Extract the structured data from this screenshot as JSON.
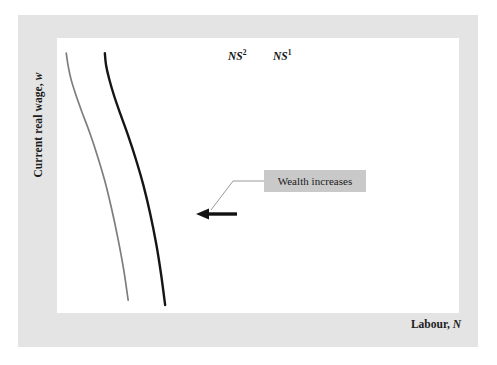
{
  "figure": {
    "background_color": "#ffffff",
    "frame_color": "#e4e4e4",
    "plot_background": "#ffffff"
  },
  "axes": {
    "y_title_prefix": "Current real wage, ",
    "y_title_symbol": "w",
    "x_title_prefix": "Labour, ",
    "x_title_symbol": "N"
  },
  "curves": {
    "ns1": {
      "label_prefix": "NS",
      "label_superscript": "1",
      "color": "#151515",
      "stroke_width": 2.4
    },
    "ns2": {
      "label_prefix": "NS",
      "label_superscript": "2",
      "color": "#7d7d7d",
      "stroke_width": 1.7
    }
  },
  "annotation": {
    "text": "Wealth increases",
    "box_color": "#c9c9c9",
    "text_color": "#1a1a1a",
    "leader_color": "#9a9a9a",
    "arrow_color": "#111111"
  },
  "chart_data": {
    "type": "line",
    "title": "",
    "subtitle": "",
    "xlabel": "Labour, N",
    "ylabel": "Current real wage, w",
    "xlim": [
      0,
      1
    ],
    "ylim": [
      0,
      1
    ],
    "grid": false,
    "legend": "inline-curve-labels",
    "axis_ticks": {
      "x": [],
      "y": []
    },
    "series": [
      {
        "name": "NS2",
        "color": "#7d7d7d",
        "description": "Labour supply curve after wealth increases (shifted left)",
        "points": [
          {
            "x": 0.177,
            "y": 0.047
          },
          {
            "x": 0.166,
            "y": 0.157
          },
          {
            "x": 0.152,
            "y": 0.268
          },
          {
            "x": 0.136,
            "y": 0.378
          },
          {
            "x": 0.119,
            "y": 0.48
          },
          {
            "x": 0.1,
            "y": 0.574
          },
          {
            "x": 0.081,
            "y": 0.657
          },
          {
            "x": 0.062,
            "y": 0.731
          },
          {
            "x": 0.046,
            "y": 0.797
          },
          {
            "x": 0.034,
            "y": 0.855
          },
          {
            "x": 0.027,
            "y": 0.905
          },
          {
            "x": 0.023,
            "y": 0.945
          }
        ]
      },
      {
        "name": "NS1",
        "color": "#151515",
        "description": "Original labour supply curve",
        "points": [
          {
            "x": 0.269,
            "y": 0.029
          },
          {
            "x": 0.259,
            "y": 0.14
          },
          {
            "x": 0.247,
            "y": 0.25
          },
          {
            "x": 0.232,
            "y": 0.36
          },
          {
            "x": 0.215,
            "y": 0.464
          },
          {
            "x": 0.196,
            "y": 0.56
          },
          {
            "x": 0.177,
            "y": 0.645
          },
          {
            "x": 0.158,
            "y": 0.722
          },
          {
            "x": 0.142,
            "y": 0.79
          },
          {
            "x": 0.13,
            "y": 0.85
          },
          {
            "x": 0.122,
            "y": 0.902
          },
          {
            "x": 0.119,
            "y": 0.945
          }
        ]
      }
    ],
    "annotations": [
      {
        "text": "Wealth increases",
        "type": "callout-box",
        "points_to": "shift from NS1 to NS2"
      },
      {
        "text": "",
        "type": "arrow",
        "direction": "left",
        "meaning": "leftward shift of labour supply curve"
      }
    ]
  }
}
